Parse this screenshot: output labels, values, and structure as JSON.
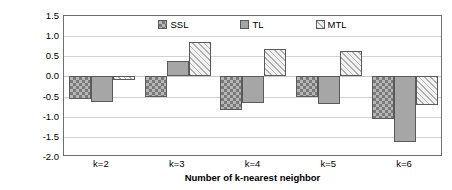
{
  "chart_data": {
    "type": "bar",
    "title": "",
    "subtitle": "",
    "xlabel": "Number of k-nearest neighbor",
    "ylabel": "Micro-F1 % improvement over STL for HD dataset",
    "ylabel_lines": [
      "Micro-F1 % improvement",
      "over STL for HD dataset"
    ],
    "categories": [
      "k=2",
      "k=3",
      "k=4",
      "k=5",
      "k=6"
    ],
    "series": [
      {
        "name": "SSL",
        "values": [
          -0.57,
          -0.52,
          -0.83,
          -0.5,
          -1.05
        ],
        "swatch": "ssl"
      },
      {
        "name": "TL",
        "values": [
          -0.63,
          0.38,
          -0.67,
          -0.68,
          -1.63
        ],
        "swatch": "tl"
      },
      {
        "name": "MTL",
        "values": [
          -0.08,
          0.86,
          0.68,
          0.62,
          -0.7
        ],
        "swatch": "mtl"
      }
    ],
    "ylim": [
      -2.0,
      1.5
    ],
    "ytick_values": [
      1.5,
      1.0,
      0.5,
      0.0,
      -0.5,
      -1.0,
      -1.5,
      -2.0
    ],
    "ytick_labels": [
      "1.5",
      "1.0",
      "0.5",
      "0.0",
      "-0.5",
      "-1.0",
      "-1.5",
      "-2.0"
    ],
    "grid": true,
    "grid_axis": "y",
    "legend_position": "top-inside",
    "colors": {
      "ssl_fill": "#b6b6b6",
      "ssl_pattern": "#7a7a7a",
      "tl_fill": "#a6a6a6",
      "mtl_fill": "#e8e8e8",
      "mtl_pattern": "#b0b0b0",
      "bar_border": "#5a5a5a",
      "gridline": "#d2d2d2",
      "axis_border": "#6f6f6f",
      "text": "#000000"
    }
  },
  "legend": {
    "items": [
      {
        "label": "SSL"
      },
      {
        "label": "TL"
      },
      {
        "label": "MTL"
      }
    ]
  }
}
